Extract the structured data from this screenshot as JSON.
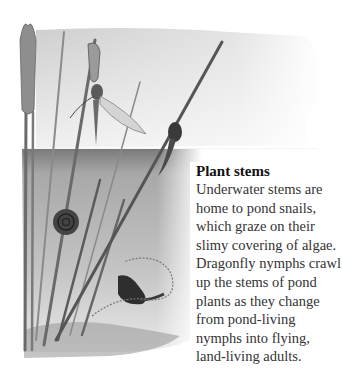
{
  "caption": {
    "title": "Plant stems",
    "body": "Underwater stems are home to pond snails, which graze on their slimy covering of algae. Dragonfly nymphs crawl up the stems of pond plants as they change from pond-living nymphs into flying, land-living adults."
  },
  "illustration": {
    "subject": "pond-scene-plant-stems",
    "elements": [
      "reed-stems",
      "bulrush-head",
      "emerging-dragonfly",
      "dragonfly-nymph",
      "ramshorn-snail",
      "pond-snail",
      "water-surface",
      "pond-bottom"
    ],
    "colors": {
      "sky": "#d9d9d9",
      "water_top": "#8a8a8a",
      "water_mid": "#b8b8b8",
      "stem": "#555555",
      "snail": "#2e2e2e"
    }
  }
}
